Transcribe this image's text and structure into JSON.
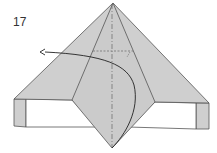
{
  "diagram": {
    "step_number": "17",
    "colors": {
      "paper": "#cfcfcf",
      "line": "#555555",
      "background": "#ffffff",
      "arrow": "#222222"
    }
  }
}
